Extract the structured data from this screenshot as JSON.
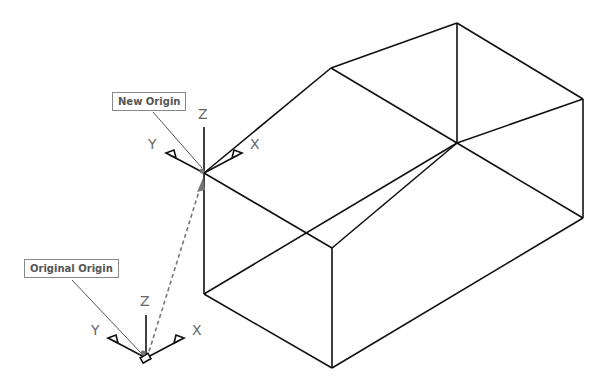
{
  "diagram": {
    "labels": {
      "new_origin": "New Origin",
      "original_origin": "Original Origin"
    },
    "new_ucs": {
      "x_label": "X",
      "y_label": "Y",
      "z_label": "Z"
    },
    "original_ucs": {
      "x_label": "X",
      "y_label": "Y",
      "z_label": "Z"
    },
    "colors": {
      "line": "#111111",
      "leader": "#555555",
      "dashed": "#777777",
      "text": "#666666"
    }
  }
}
